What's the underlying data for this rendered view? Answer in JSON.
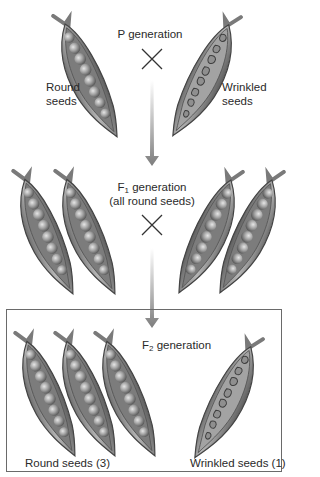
{
  "diagram": {
    "title_fragment_top": "",
    "p_generation": {
      "label": "P generation",
      "left_label_line1": "Round",
      "left_label_line2": "seeds",
      "right_label_line1": "Wrinkled",
      "right_label_line2": "seeds",
      "cross_symbol": "cross-icon"
    },
    "f1_generation": {
      "label_prefix": "F",
      "label_sub": "1",
      "label_suffix": " generation",
      "label_line2": "(all round seeds)",
      "cross_symbol": "cross-icon"
    },
    "f2_generation": {
      "label_prefix": "F",
      "label_sub": "2",
      "label_suffix": " generation",
      "round_label": "Round seeds (3)",
      "wrinkled_label": "Wrinkled seeds (1)"
    },
    "colors": {
      "pod_fill": "#8a8a8a",
      "pod_outline": "#4a4a4a",
      "pea_fill": "#9b9b9b",
      "arrow": "#8c8c8c",
      "box_border": "#6a6a6a"
    }
  }
}
